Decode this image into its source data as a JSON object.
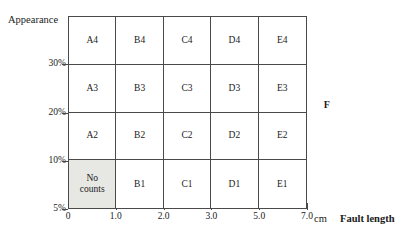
{
  "chart_data": {
    "type": "table",
    "title": "",
    "subtitle": "",
    "xlabel": "Fault length",
    "xunit": "cm",
    "ylabel": "Appearance",
    "grid": true,
    "legend": "none",
    "x_ticks": [
      "0",
      "1.0",
      "2.0",
      "3.0",
      "5.0",
      "7.0"
    ],
    "x_tick_positions_pct": [
      0,
      20,
      40,
      60,
      80,
      100
    ],
    "y_ticks": [
      "5%",
      "10%",
      "20%",
      "30%"
    ],
    "y_tick_positions_pct": [
      0,
      25,
      50,
      75
    ],
    "columns": [
      "A",
      "B",
      "C",
      "D",
      "E"
    ],
    "rows": [
      "4",
      "3",
      "2",
      "1"
    ],
    "cells": [
      [
        {
          "label": "A4",
          "lines": [
            "A4"
          ],
          "shaded": false
        },
        {
          "label": "B4",
          "lines": [
            "B4"
          ],
          "shaded": false
        },
        {
          "label": "C4",
          "lines": [
            "C4"
          ],
          "shaded": false
        },
        {
          "label": "D4",
          "lines": [
            "D4"
          ],
          "shaded": false
        },
        {
          "label": "E4",
          "lines": [
            "E4"
          ],
          "shaded": false
        }
      ],
      [
        {
          "label": "A3",
          "lines": [
            "A3"
          ],
          "shaded": false
        },
        {
          "label": "B3",
          "lines": [
            "B3"
          ],
          "shaded": false
        },
        {
          "label": "C3",
          "lines": [
            "C3"
          ],
          "shaded": false
        },
        {
          "label": "D3",
          "lines": [
            "D3"
          ],
          "shaded": false
        },
        {
          "label": "E3",
          "lines": [
            "E3"
          ],
          "shaded": false
        }
      ],
      [
        {
          "label": "A2",
          "lines": [
            "A2"
          ],
          "shaded": false
        },
        {
          "label": "B2",
          "lines": [
            "B2"
          ],
          "shaded": false
        },
        {
          "label": "C2",
          "lines": [
            "C2"
          ],
          "shaded": false
        },
        {
          "label": "D2",
          "lines": [
            "D2"
          ],
          "shaded": false
        },
        {
          "label": "E2",
          "lines": [
            "E2"
          ],
          "shaded": false
        }
      ],
      [
        {
          "label": "No counts",
          "lines": [
            "No",
            "counts"
          ],
          "shaded": true
        },
        {
          "label": "B1",
          "lines": [
            "B1"
          ],
          "shaded": false
        },
        {
          "label": "C1",
          "lines": [
            "C1"
          ],
          "shaded": false
        },
        {
          "label": "D1",
          "lines": [
            "D1"
          ],
          "shaded": false
        },
        {
          "label": "E1",
          "lines": [
            "E1"
          ],
          "shaded": false
        }
      ]
    ],
    "annotations": [
      {
        "text": "F",
        "x_pct": 107,
        "y_pct": 54,
        "bold": true
      }
    ],
    "colors": {
      "line": "#4a4a4a",
      "text": "#1a1a1a",
      "shaded_cell": "#e7e7e4",
      "background": "#ffffff"
    }
  },
  "axes": {
    "y_title": "Appearance",
    "x_title": "Fault length",
    "x_unit": "cm"
  }
}
